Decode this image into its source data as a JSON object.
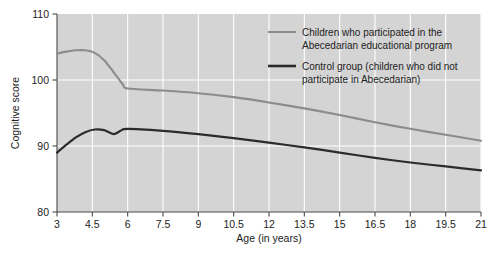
{
  "chart_data": {
    "type": "line",
    "title": "",
    "xlabel": "Age (in years)",
    "ylabel": "Cognitive score",
    "xlim": [
      3,
      21
    ],
    "ylim": [
      80,
      110
    ],
    "xticks": [
      "3",
      "4.5",
      "6",
      "7.5",
      "9",
      "10.5",
      "12",
      "13.5",
      "15",
      "16.5",
      "18",
      "19.5",
      "21"
    ],
    "yticks": [
      "80",
      "90",
      "100",
      "110"
    ],
    "grid": "white gridlines at x ticks and y=90,100",
    "legend_position": "inside-top-right",
    "plot_background": "#d4d4d4",
    "series": [
      {
        "name": "Children who participated in the Abecedarian educational program",
        "color": "#8c8c8c",
        "x": [
          3,
          3.4,
          3.8,
          4.2,
          4.6,
          5.0,
          5.4,
          5.8,
          6.0,
          7.5,
          9,
          10.5,
          12,
          13.5,
          15,
          16.5,
          18,
          19.5,
          21
        ],
        "values": [
          104.0,
          104.3,
          104.5,
          104.5,
          104.1,
          103.0,
          101.2,
          99.3,
          98.7,
          98.4,
          98.0,
          97.4,
          96.6,
          95.7,
          94.7,
          93.6,
          92.6,
          91.7,
          90.8
        ]
      },
      {
        "name": "Control group (children who did not participate in Abecedarian)",
        "color": "#2b2b2b",
        "x": [
          3,
          3.4,
          3.8,
          4.2,
          4.6,
          5.0,
          5.4,
          5.7,
          6.0,
          7.5,
          9,
          10.5,
          12,
          13.5,
          15,
          16.5,
          18,
          19.5,
          21
        ],
        "values": [
          89.0,
          90.2,
          91.3,
          92.1,
          92.5,
          92.4,
          91.8,
          92.3,
          92.6,
          92.3,
          91.8,
          91.2,
          90.5,
          89.8,
          89.0,
          88.2,
          87.5,
          86.9,
          86.3
        ]
      }
    ]
  },
  "legend": {
    "entries": [
      {
        "line1": "Children who participated in the",
        "line2": "Abecedarian educational program",
        "swatch": "gray-line-swatch"
      },
      {
        "line1": "Control group (children who did not",
        "line2": "participate in Abecedarian)",
        "swatch": "black-line-swatch"
      }
    ]
  }
}
